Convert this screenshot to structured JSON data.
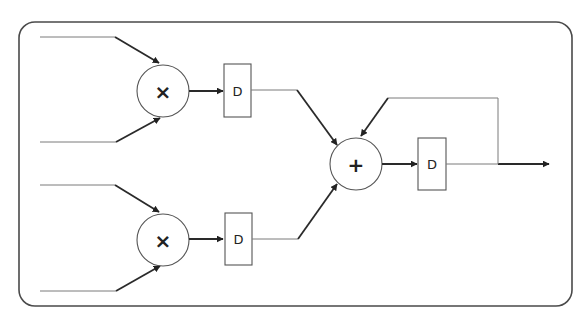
{
  "diagram": {
    "type": "signal-flow / multiply-accumulate block diagram",
    "frame": {
      "shape": "rounded-rectangle"
    },
    "nodes": {
      "mult_top": {
        "symbol": "×",
        "kind": "multiplier"
      },
      "mult_bottom": {
        "symbol": "×",
        "kind": "multiplier"
      },
      "adder": {
        "symbol": "+",
        "kind": "adder"
      },
      "delay_top": {
        "label": "D",
        "kind": "delay"
      },
      "delay_bottom": {
        "label": "D",
        "kind": "delay"
      },
      "delay_out": {
        "label": "D",
        "kind": "delay"
      }
    },
    "edges": [
      "input 1 -> mult_top",
      "input 2 -> mult_top",
      "input 3 -> mult_bottom",
      "input 4 -> mult_bottom",
      "mult_top -> delay_top",
      "mult_bottom -> delay_bottom",
      "delay_top -> adder",
      "delay_bottom -> adder",
      "adder -> delay_out",
      "delay_out -> output",
      "delay_out (feedback) -> adder"
    ],
    "colors": {
      "stroke": "#555555",
      "arrow": "#2a2a2a",
      "background": "#ffffff"
    }
  }
}
